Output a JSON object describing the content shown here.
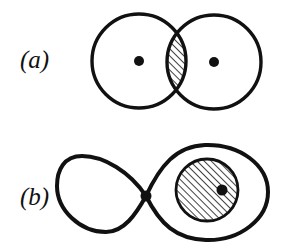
{
  "figure": {
    "background_color": "#ffffff",
    "ink_color": "#111111",
    "width": 286,
    "height": 250,
    "panels": [
      {
        "id": "a",
        "label": "(a)",
        "label_x": 20,
        "label_y": 68,
        "description": "two overlapping circles with marked centers and hatched lens intersection",
        "shapes": {
          "circles": [
            {
              "name": "left-circle",
              "cx": 139,
              "cy": 61,
              "r": 47,
              "fill": "none",
              "stroke_width": 3.2
            },
            {
              "name": "right-circle",
              "cx": 214,
              "cy": 62,
              "r": 47,
              "fill": "none",
              "stroke_width": 3.2
            }
          ],
          "center_dots": [
            {
              "name": "left-center-dot",
              "cx": 139,
              "cy": 61,
              "r": 5
            },
            {
              "name": "right-center-dot",
              "cx": 214,
              "cy": 62,
              "r": 5
            }
          ],
          "hatched_region": {
            "name": "lens-intersection",
            "hatch_angle_deg": 45,
            "hatch_spacing": 5,
            "hatch_stroke_width": 1.5
          }
        }
      },
      {
        "id": "b",
        "label": "(b)",
        "label_x": 20,
        "label_y": 205,
        "description": "figure-eight lemniscate with a node dot and a hatched disc containing a dot on the right lobe",
        "shapes": {
          "lemniscate": {
            "name": "figure-eight-curve",
            "node_x": 146,
            "node_y": 196,
            "left_lobe_extent_x": 58,
            "right_lobe_extent_x": 268,
            "stroke_width": 4
          },
          "node_dot": {
            "name": "crossing-node-dot",
            "cx": 146,
            "cy": 196,
            "r": 5.5
          },
          "hatched_disc": {
            "name": "hatched-disc",
            "cx": 207,
            "cy": 190,
            "r": 31,
            "stroke_width": 2.6,
            "hatch_angle_deg": 45,
            "hatch_spacing": 5,
            "hatch_stroke_width": 1.5
          },
          "interior_dot": {
            "name": "disc-interior-dot",
            "cx": 222,
            "cy": 190,
            "r": 5.5
          }
        }
      }
    ]
  }
}
